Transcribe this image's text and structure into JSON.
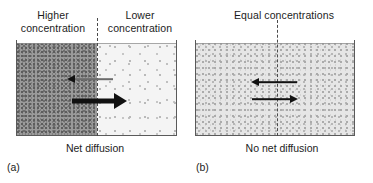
{
  "figure": {
    "panels": [
      {
        "id": "a",
        "letter": "(a)",
        "caption": "Net diffusion",
        "labels": {
          "left": "Higher\nconcentration",
          "left_line1": "Higher",
          "left_line2": "concentration",
          "right_line1": "Lower",
          "right_line2": "concentration"
        },
        "regions": [
          {
            "name": "left-compartment",
            "concentration": "high",
            "fill": "#9a9a9a"
          },
          {
            "name": "right-compartment",
            "concentration": "low",
            "fill": "#f4f4f4"
          }
        ],
        "arrows": [
          {
            "name": "leftward-flux",
            "direction": "left",
            "weight": "thin",
            "meaning": "small flux right-to-left"
          },
          {
            "name": "rightward-flux",
            "direction": "right",
            "weight": "thick",
            "meaning": "large flux left-to-right"
          }
        ]
      },
      {
        "id": "b",
        "letter": "(b)",
        "caption": "No net diffusion",
        "labels": {
          "top": "Equal concentrations"
        },
        "regions": [
          {
            "name": "left-compartment",
            "concentration": "equal",
            "fill": "#e6e6e6"
          },
          {
            "name": "right-compartment",
            "concentration": "equal",
            "fill": "#e6e6e6"
          }
        ],
        "arrows": [
          {
            "name": "leftward-flux",
            "direction": "left",
            "weight": "thin",
            "meaning": "flux right-to-left"
          },
          {
            "name": "rightward-flux",
            "direction": "right",
            "weight": "thin",
            "meaning": "equal flux left-to-right"
          }
        ]
      }
    ],
    "colors": {
      "high_concentration": "#9a9a9a",
      "low_concentration": "#f4f4f4",
      "equal_concentration": "#e6e6e6",
      "vessel_wall": "#5a5a5a",
      "divider": "#4a4a4a",
      "arrow": "#111111",
      "text": "#1c1c1c",
      "background": "#ffffff"
    }
  }
}
